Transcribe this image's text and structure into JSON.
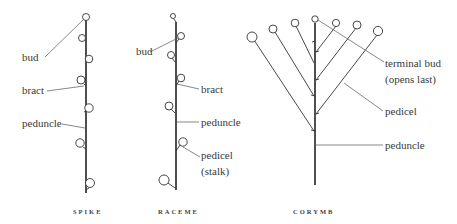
{
  "diagrams": {
    "spike": {
      "caption": "SPIKE",
      "labels": {
        "bud": "bud",
        "bract": "bract",
        "peduncle": "peduncle"
      }
    },
    "raceme": {
      "caption": "RACEME",
      "labels": {
        "bud": "bud",
        "bract": "bract",
        "peduncle": "peduncle",
        "pedicel": "pedicel",
        "stalk": "(stalk)"
      }
    },
    "corymb": {
      "caption": "CORYMB",
      "labels": {
        "terminal_bud": "terminal bud",
        "opens_last": "(opens last)",
        "pedicel": "pedicel",
        "peduncle": "peduncle"
      }
    }
  },
  "colors": {
    "ink": "#222222",
    "label": "#3a3a3a",
    "background": "#ffffff"
  }
}
